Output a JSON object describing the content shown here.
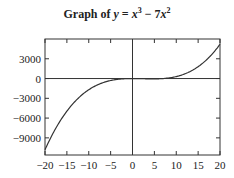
{
  "chart_data": {
    "type": "line",
    "title_parts": {
      "prefix": "Graph of ",
      "var": "y",
      "eq": " = ",
      "x1": "x",
      "exp1": "3",
      "minus": " − 7",
      "x2": "x",
      "exp2": "2"
    },
    "xlabel": "",
    "ylabel": "",
    "xlim": [
      -20,
      20
    ],
    "ylim": [
      -11600,
      6000
    ],
    "x_ticks": [
      -20,
      -15,
      -10,
      -5,
      0,
      5,
      10,
      15,
      20
    ],
    "x_tick_labels": [
      "−20",
      "−15",
      "−10",
      "−5",
      "0",
      "5",
      "10",
      "15",
      "20"
    ],
    "y_ticks": [
      3000,
      0,
      -3000,
      -6000,
      -9000
    ],
    "y_tick_labels": [
      "3000",
      "0",
      "−3000",
      "−6000",
      "−9000"
    ],
    "grid": false,
    "series": [
      {
        "name": "y = x^3 - 7x^2",
        "x": [
          -20,
          -17.5,
          -15,
          -12.5,
          -10,
          -7.5,
          -5,
          -2.5,
          0,
          2.5,
          5,
          7.5,
          10,
          12.5,
          15,
          17.5,
          20
        ],
        "values": [
          -10800,
          -7503.1,
          -4950,
          -3046.9,
          -1700,
          -815.6,
          -300,
          -59.4,
          0,
          -28.1,
          -50,
          28.1,
          300,
          859.4,
          1800,
          3215.6,
          5200
        ]
      }
    ],
    "color": "#333333"
  }
}
